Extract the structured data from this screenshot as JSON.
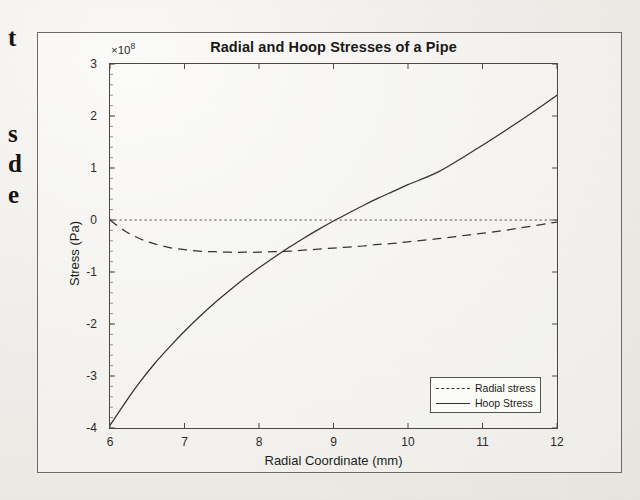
{
  "document": {
    "background_color": "#f1efec",
    "text_fragments": [
      {
        "text": "t",
        "x": 8,
        "y": 24
      },
      {
        "text": "s",
        "x": 8,
        "y": 120
      },
      {
        "text": "d",
        "x": 8,
        "y": 150
      },
      {
        "text": "e",
        "x": 8,
        "y": 181
      }
    ]
  },
  "figure": {
    "title": "Radial and Hoop Stresses of a Pipe",
    "exponent_label": "×10",
    "exponent_power": "8",
    "border_color": "#6e6b66"
  },
  "chart_data": {
    "type": "line",
    "title": "Radial and Hoop Stresses of a Pipe",
    "xlabel": "Radial Coordinate (mm)",
    "ylabel": "Stress (Pa)",
    "y_exponent": 8,
    "xlim": [
      6,
      12
    ],
    "ylim": [
      -4,
      3
    ],
    "xticks": [
      6,
      7,
      8,
      9,
      10,
      11,
      12
    ],
    "yticks": [
      3,
      2,
      1,
      0,
      -1,
      -2,
      -3,
      -4
    ],
    "xtick_labels": [
      "6",
      "7",
      "8",
      "9",
      "10",
      "11",
      "12"
    ],
    "ytick_labels": [
      "3",
      "2",
      "1",
      "0",
      "-1",
      "-2",
      "-3",
      "-4"
    ],
    "grid": false,
    "legend_position": "lower right",
    "series": [
      {
        "name": "Radial stress",
        "style": "dashed",
        "color": "#35332f",
        "x": [
          6.0,
          6.2,
          6.4,
          6.6,
          6.8,
          7.0,
          7.2,
          7.4,
          7.6,
          7.8,
          8.0,
          8.2,
          8.4,
          8.6,
          8.8,
          9.0,
          9.2,
          9.4,
          9.6,
          9.8,
          10.0,
          10.4,
          10.8,
          11.2,
          11.6,
          12.0
        ],
        "y": [
          0.0,
          -0.21,
          -0.36,
          -0.46,
          -0.53,
          -0.57,
          -0.6,
          -0.61,
          -0.62,
          -0.62,
          -0.62,
          -0.61,
          -0.6,
          -0.58,
          -0.56,
          -0.54,
          -0.52,
          -0.5,
          -0.47,
          -0.45,
          -0.42,
          -0.36,
          -0.29,
          -0.22,
          -0.13,
          -0.04
        ]
      },
      {
        "name": "Hoop Stress",
        "style": "solid",
        "color": "#35332f",
        "x": [
          6.0,
          6.2,
          6.4,
          6.6,
          6.8,
          7.0,
          7.2,
          7.4,
          7.6,
          7.8,
          8.0,
          8.2,
          8.4,
          8.6,
          8.8,
          9.0,
          9.2,
          9.4,
          9.6,
          9.8,
          10.0,
          10.4,
          10.8,
          11.2,
          11.6,
          12.0
        ],
        "y": [
          -3.95,
          -3.52,
          -3.12,
          -2.76,
          -2.44,
          -2.14,
          -1.86,
          -1.6,
          -1.36,
          -1.13,
          -0.92,
          -0.72,
          -0.53,
          -0.35,
          -0.18,
          -0.02,
          0.13,
          0.28,
          0.42,
          0.55,
          0.68,
          0.92,
          1.26,
          1.62,
          2.0,
          2.4
        ]
      },
      {
        "name": "zero-reference",
        "style": "dotted",
        "color": "#55534e",
        "x": [
          6.0,
          12.0
        ],
        "y": [
          0.0,
          0.0
        ]
      }
    ],
    "legend": [
      {
        "label": "Radial stress",
        "style": "dashed"
      },
      {
        "label": "Hoop Stress",
        "style": "solid"
      }
    ]
  }
}
